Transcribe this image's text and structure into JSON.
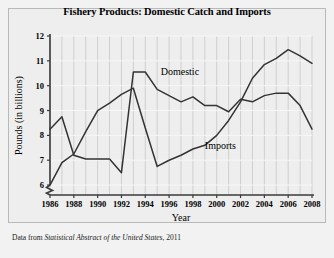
{
  "figure": {
    "background_color": "#f2f2f2",
    "plot_background_color": "#eeeeee",
    "border_color": "#b9b9b9"
  },
  "source_note": {
    "prefix": "Data from ",
    "italic_part": "Statistical Abstract of the United States",
    "suffix": ", 2011"
  },
  "chart_data": {
    "type": "line",
    "title": "Fishery Products: Domestic Catch and Imports",
    "xlabel": "Year",
    "ylabel": "Pounds (in billions)",
    "xlim": [
      1986,
      2008
    ],
    "ylim": [
      5.6,
      12
    ],
    "yaxis_break": true,
    "grid": true,
    "grid_orientation": "both",
    "legend_position": "inline-annotations",
    "line_color": "#333333",
    "xticks": [
      1986,
      1988,
      1990,
      1992,
      1994,
      1996,
      1998,
      2000,
      2002,
      2004,
      2006,
      2008
    ],
    "xtick_labels": [
      "1986",
      "1988",
      "1990",
      "1992",
      "1994",
      "1996",
      "1998",
      "2000",
      "2002",
      "2004",
      "2006",
      "2008"
    ],
    "yticks": [
      6,
      7,
      8,
      9,
      10,
      11,
      12
    ],
    "ytick_labels": [
      "6",
      "7",
      "8",
      "9",
      "10",
      "11",
      "12"
    ],
    "x": [
      1986,
      1987,
      1988,
      1989,
      1990,
      1991,
      1992,
      1993,
      1994,
      1995,
      1996,
      1997,
      1998,
      1999,
      2000,
      2001,
      2002,
      2003,
      2004,
      2005,
      2006,
      2007,
      2008
    ],
    "series": [
      {
        "name": "Domestic",
        "label": "Domestic",
        "values": [
          8.25,
          8.75,
          7.2,
          7.05,
          7.05,
          7.05,
          6.5,
          10.55,
          10.55,
          9.85,
          9.6,
          9.35,
          9.55,
          9.2,
          9.2,
          8.95,
          9.45,
          9.35,
          9.6,
          9.7,
          9.7,
          9.2,
          8.25
        ]
      },
      {
        "name": "Imports",
        "label": "Imports",
        "values": [
          6.0,
          6.9,
          7.25,
          8.15,
          9.0,
          9.3,
          9.65,
          9.9,
          8.3,
          6.75,
          7.0,
          7.2,
          7.45,
          7.6,
          8.0,
          8.6,
          9.35,
          10.3,
          10.85,
          11.1,
          11.45,
          11.2,
          10.9
        ]
      }
    ],
    "annotations": [
      {
        "text": "Domestic",
        "x": 1995.3,
        "y": 10.45
      },
      {
        "text": "Imports",
        "x": 1999.0,
        "y": 7.45
      }
    ]
  }
}
